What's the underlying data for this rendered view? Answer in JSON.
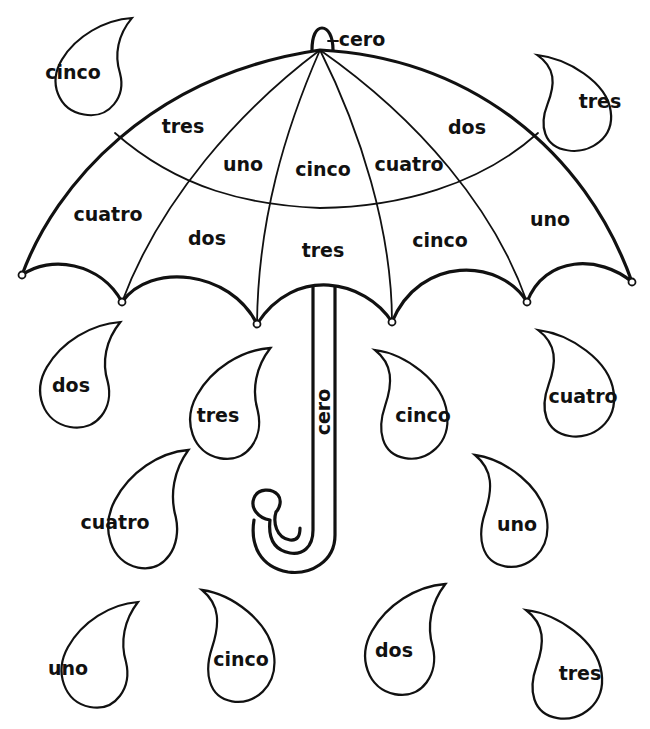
{
  "worksheet": {
    "title": "Umbrella number-word coloring page",
    "language": "Spanish",
    "ink_color": "#111111",
    "paper_color": "#ffffff"
  },
  "umbrella": {
    "knob_label": "cero",
    "handle_label": "cero",
    "canopy_outer_row": [
      {
        "label": "cuatro"
      },
      {
        "label": "dos"
      },
      {
        "label": "tres"
      },
      {
        "label": "cinco"
      },
      {
        "label": "uno"
      }
    ],
    "canopy_inner_row": [
      {
        "label": "tres"
      },
      {
        "label": "uno"
      },
      {
        "label": "cinco"
      },
      {
        "label": "cuatro"
      },
      {
        "label": "dos"
      }
    ]
  },
  "raindrops": [
    {
      "label": "cinco"
    },
    {
      "label": "tres"
    },
    {
      "label": "dos"
    },
    {
      "label": "tres"
    },
    {
      "label": "cinco"
    },
    {
      "label": "cuatro"
    },
    {
      "label": "cuatro"
    },
    {
      "label": "uno"
    },
    {
      "label": "uno"
    },
    {
      "label": "cinco"
    },
    {
      "label": "dos"
    },
    {
      "label": "tres"
    }
  ]
}
